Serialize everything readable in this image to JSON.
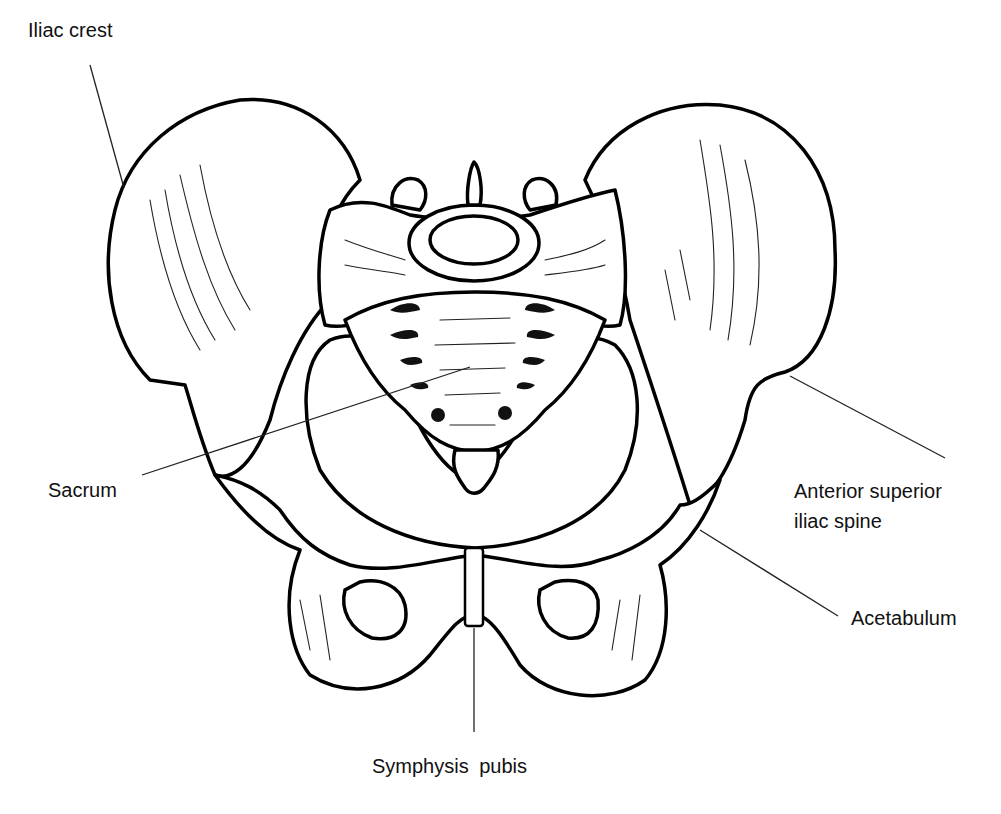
{
  "diagram": {
    "type": "anatomical line drawing",
    "background": "#ffffff",
    "line_color": "#000000"
  },
  "labels": {
    "iliac_crest": "Iliac crest",
    "sacrum": "Sacrum",
    "asis_line1": "Anterior superior",
    "asis_line2": "iliac spine",
    "acetabulum": "Acetabulum",
    "symphysis_pubis": "Symphysis  pubis"
  },
  "leaders": [
    {
      "label": "Iliac crest",
      "from": [
        90,
        65
      ],
      "to": [
        124,
        188
      ]
    },
    {
      "label": "Sacrum",
      "from": [
        142,
        475
      ],
      "to": [
        470,
        367
      ]
    },
    {
      "label": "Anterior superior iliac spine",
      "from": [
        790,
        376
      ],
      "to": [
        945,
        458
      ]
    },
    {
      "label": "Acetabulum",
      "from": [
        700,
        530
      ],
      "to": [
        838,
        616
      ]
    },
    {
      "label": "Symphysis pubis",
      "from": [
        474,
        628
      ],
      "to": [
        474,
        732
      ]
    }
  ]
}
